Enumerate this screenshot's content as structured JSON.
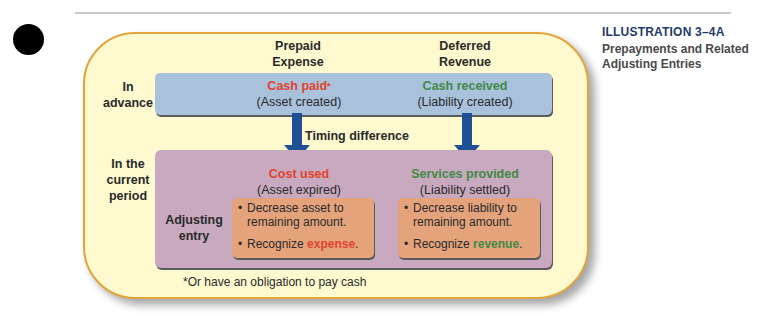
{
  "sidebar": {
    "illustration_label": "ILLUSTRATION 3–4A",
    "caption": "Prepayments and Related Adjusting Entries"
  },
  "diagram": {
    "columns": [
      {
        "line1": "Prepaid",
        "line2": "Expense"
      },
      {
        "line1": "Deferred",
        "line2": "Revenue"
      }
    ],
    "rows": {
      "advance": {
        "line1": "In",
        "line2": "advance"
      },
      "current": {
        "line1": "In the",
        "line2": "current",
        "line3": "period"
      },
      "adjusting": {
        "line1": "Adjusting",
        "line2": "entry"
      }
    },
    "advance_cells": [
      {
        "highlight": "Cash paid",
        "marker": "*",
        "sub": "(Asset created)",
        "color": "#e2432d"
      },
      {
        "highlight": "Cash received",
        "marker": "",
        "sub": "(Liability created)",
        "color": "#3f8a46"
      }
    ],
    "timing_label": "Timing difference",
    "current_cells": [
      {
        "highlight": "Cost used",
        "sub": "(Asset expired)",
        "color": "#e2432d"
      },
      {
        "highlight": "Services provided",
        "sub": "(Liability settled)",
        "color": "#3f8a46"
      }
    ],
    "adjusting_entries": [
      {
        "bullet1": "Decrease asset to remaining amount.",
        "bullet2_prefix": "Recognize ",
        "bullet2_highlight": "expense",
        "bullet2_suffix": "."
      },
      {
        "bullet1": "Decrease liability to remaining amount.",
        "bullet2_prefix": "Recognize ",
        "bullet2_highlight": "revenue",
        "bullet2_suffix": "."
      }
    ],
    "footnote": "*Or have an obligation to pay cash"
  },
  "colors": {
    "frame_fill": "#fff9cf",
    "frame_border": "#e0a43a",
    "advance_box": "#a9c1db",
    "current_box": "#c8a9bf",
    "entry_box": "#e5a37c",
    "arrow": "#1f4f94",
    "expense_red": "#e2432d",
    "revenue_green": "#3f8a46",
    "title_navy": "#1f3a6b"
  }
}
